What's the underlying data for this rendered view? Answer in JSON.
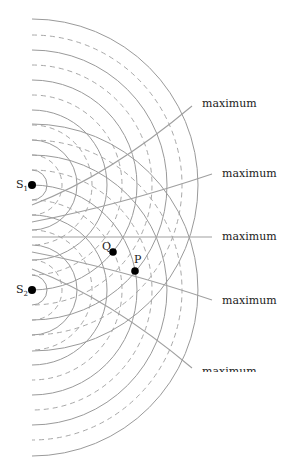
{
  "diagram": {
    "sources": [
      {
        "label": "S",
        "sub": "1",
        "x": 32,
        "y": 185
      },
      {
        "label": "S",
        "sub": "2",
        "x": 32,
        "y": 290
      }
    ],
    "points": [
      {
        "label": "Q",
        "x": 113,
        "y": 252
      },
      {
        "label": "P",
        "x": 135,
        "y": 271
      }
    ],
    "crest_radii": [
      15,
      45,
      75,
      105,
      135,
      166
    ],
    "trough_radii": [
      30,
      60,
      90,
      120,
      150
    ],
    "maxima_labels": [
      "maximum",
      "maximum",
      "maximum",
      "maximum",
      "maximum"
    ],
    "colors": {
      "wave": "#9a9a9a",
      "maxline": "#9a9a9a",
      "dot": "#000000",
      "text": "#222222"
    }
  }
}
